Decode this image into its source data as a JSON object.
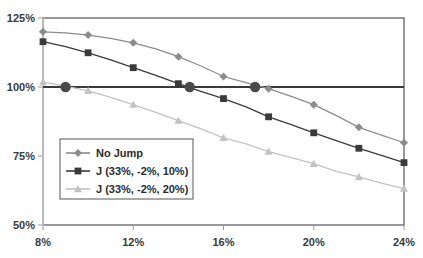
{
  "chart_data": {
    "type": "line",
    "title": "",
    "xlabel": "",
    "ylabel": "",
    "xlim": [
      8,
      24
    ],
    "ylim": [
      50,
      125
    ],
    "grid": false,
    "legend_position": "inside-lower-left",
    "x": [
      8,
      9,
      10,
      11,
      12,
      13,
      14,
      15,
      16,
      17,
      18,
      19,
      20,
      21,
      22,
      23,
      24
    ],
    "xticks": [
      8,
      12,
      16,
      20,
      24
    ],
    "xtick_labels": [
      "8%",
      "12%",
      "16%",
      "20%",
      "24%"
    ],
    "yticks": [
      50,
      75,
      100,
      125
    ],
    "ytick_labels": [
      "50%",
      "75%",
      "100%",
      "125%"
    ],
    "reference_line": {
      "value": 100,
      "label": "100%",
      "color": "#3a3a3a"
    },
    "crossing_markers": [
      {
        "x": 9.0,
        "y": 100,
        "series": "J (33%, -2%, 20%)"
      },
      {
        "x": 14.5,
        "y": 100,
        "series": "J (33%, -2%, 10%)"
      },
      {
        "x": 17.4,
        "y": 100,
        "series": "No Jump"
      }
    ],
    "series": [
      {
        "name": "No Jump",
        "marker": "diamond",
        "color": "#8c8c8c",
        "values": [
          120.0,
          119.6,
          118.8,
          117.6,
          116.0,
          113.8,
          111.0,
          107.6,
          103.8,
          101.6,
          99.4,
          96.6,
          93.6,
          89.6,
          85.4,
          82.6,
          79.8
        ]
      },
      {
        "name": "J (33%, -2%, 10%)",
        "marker": "square",
        "color": "#3a3a3a",
        "values": [
          116.4,
          114.6,
          112.4,
          109.8,
          107.0,
          104.2,
          101.2,
          98.4,
          95.8,
          92.8,
          89.2,
          86.4,
          83.4,
          80.6,
          77.8,
          75.2,
          72.6
        ]
      },
      {
        "name": "J (33%, -2%, 20%)",
        "marker": "triangle",
        "color": "#c2c2c2",
        "values": [
          101.8,
          100.3,
          98.6,
          96.2,
          93.6,
          90.8,
          87.8,
          84.8,
          81.6,
          79.4,
          76.6,
          74.4,
          72.2,
          69.4,
          67.4,
          65.2,
          63.2
        ]
      }
    ]
  },
  "legend": {
    "entries": [
      {
        "label": "No Jump",
        "marker": "diamond-icon",
        "color": "#8c8c8c"
      },
      {
        "label": "J (33%, -2%, 10%)",
        "marker": "square-icon",
        "color": "#3a3a3a"
      },
      {
        "label": "J (33%, -2%, 20%)",
        "marker": "triangle-icon",
        "color": "#c2c2c2"
      }
    ]
  },
  "axes": {
    "frame_color": "#555555",
    "tick_color": "#9a9a9a"
  }
}
